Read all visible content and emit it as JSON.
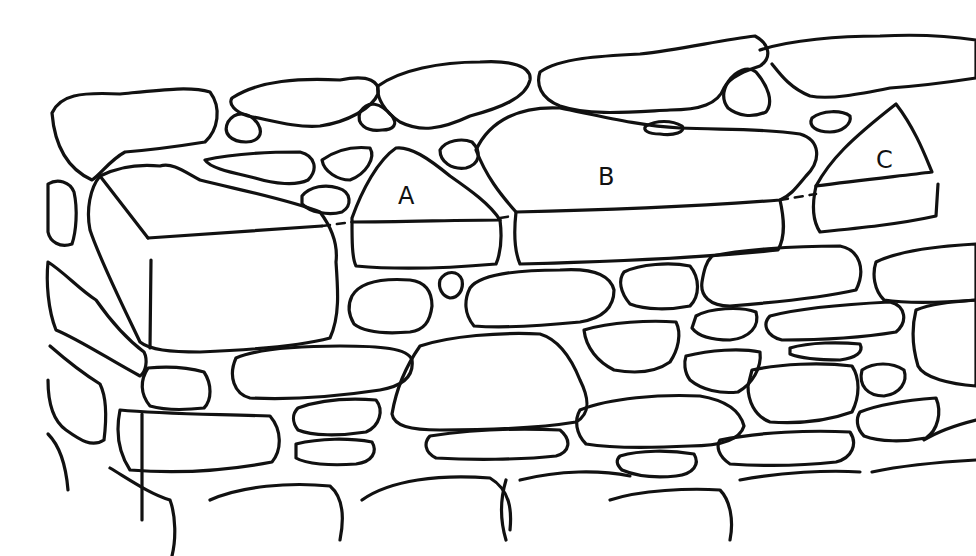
{
  "figure": {
    "stroke_color": "#111111",
    "background": "#ffffff",
    "labels": [
      {
        "id": "A",
        "text": "A"
      },
      {
        "id": "B",
        "text": "B"
      },
      {
        "id": "C",
        "text": "C"
      }
    ]
  }
}
